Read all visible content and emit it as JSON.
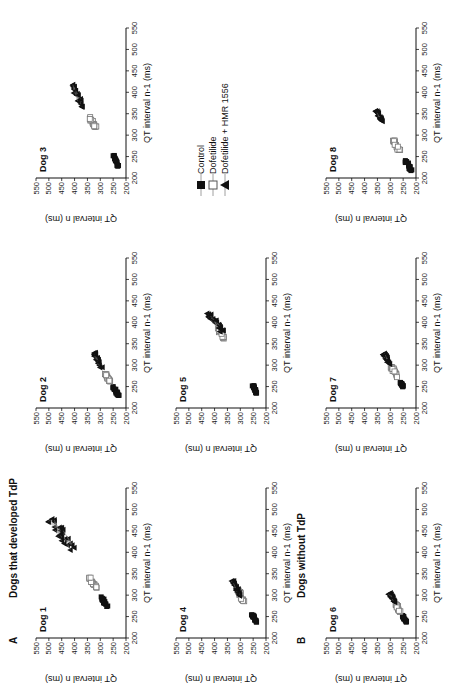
{
  "figure": {
    "sections": [
      {
        "letter": "A",
        "title": "Dogs that developed TdP"
      },
      {
        "letter": "B",
        "title": "Dogs without TdP"
      }
    ],
    "legend": {
      "items": [
        {
          "label": "Control",
          "marker": "filled-square"
        },
        {
          "label": "Dofetilide",
          "marker": "open-square"
        },
        {
          "label": "Dofetilide + HMR 1556",
          "marker": "filled-triangle"
        }
      ]
    },
    "axes": {
      "xlabel": "QT interval n-1 (ms)",
      "ylabel": "QT interval n (ms)",
      "ticks": [
        "200",
        "250",
        "300",
        "350",
        "400",
        "450",
        "500",
        "550"
      ]
    }
  },
  "chart_data": [
    {
      "type": "scatter",
      "title": "Dog 1",
      "group": "Dogs that developed TdP",
      "xlabel": "QT interval n-1 (ms)",
      "ylabel": "QT interval n (ms)",
      "xlim": [
        200,
        550
      ],
      "ylim": [
        200,
        550
      ],
      "series": [
        {
          "name": "Control",
          "center": [
            285,
            285
          ],
          "spread": [
            12,
            12
          ]
        },
        {
          "name": "Dofetilide",
          "center": [
            330,
            330
          ],
          "spread": [
            12,
            12
          ]
        },
        {
          "name": "Dofetilide + HMR 1556",
          "center": [
            440,
            450
          ],
          "spread": [
            40,
            45
          ]
        }
      ]
    },
    {
      "type": "scatter",
      "title": "Dog 2",
      "group": "Dogs that developed TdP",
      "xlabel": "QT interval n-1 (ms)",
      "ylabel": "QT interval n (ms)",
      "xlim": [
        200,
        550
      ],
      "ylim": [
        200,
        550
      ],
      "series": [
        {
          "name": "Control",
          "center": [
            240,
            240
          ],
          "spread": [
            10,
            10
          ]
        },
        {
          "name": "Dofetilide",
          "center": [
            270,
            270
          ],
          "spread": [
            10,
            10
          ]
        },
        {
          "name": "Dofetilide + HMR 1556",
          "center": [
            310,
            310
          ],
          "spread": [
            20,
            15
          ]
        }
      ]
    },
    {
      "type": "scatter",
      "title": "Dog 3",
      "group": "Dogs that developed TdP",
      "xlabel": "QT interval n-1 (ms)",
      "ylabel": "QT interval n (ms)",
      "xlim": [
        200,
        550
      ],
      "ylim": [
        200,
        550
      ],
      "series": [
        {
          "name": "Control",
          "center": [
            240,
            240
          ],
          "spread": [
            12,
            10
          ]
        },
        {
          "name": "Dofetilide",
          "center": [
            330,
            330
          ],
          "spread": [
            12,
            12
          ]
        },
        {
          "name": "Dofetilide + HMR 1556",
          "center": [
            390,
            390
          ],
          "spread": [
            30,
            25
          ]
        }
      ]
    },
    {
      "type": "scatter",
      "title": "Dog 4",
      "group": "Dogs that developed TdP",
      "xlabel": "QT interval n-1 (ms)",
      "ylabel": "QT interval n (ms)",
      "xlim": [
        200,
        550
      ],
      "ylim": [
        200,
        550
      ],
      "series": [
        {
          "name": "Control",
          "center": [
            245,
            245
          ],
          "spread": [
            10,
            10
          ]
        },
        {
          "name": "Dofetilide",
          "center": [
            300,
            300
          ],
          "spread": [
            15,
            12
          ]
        },
        {
          "name": "Dofetilide + HMR 1556",
          "center": [
            315,
            315
          ],
          "spread": [
            18,
            15
          ]
        }
      ]
    },
    {
      "type": "scatter",
      "title": "Dog 5",
      "group": "Dogs that developed TdP",
      "xlabel": "QT interval n-1 (ms)",
      "ylabel": "QT interval n (ms)",
      "xlim": [
        200,
        550
      ],
      "ylim": [
        200,
        550
      ],
      "series": [
        {
          "name": "Control",
          "center": [
            245,
            245
          ],
          "spread": [
            10,
            8
          ]
        },
        {
          "name": "Dofetilide",
          "center": [
            375,
            375
          ],
          "spread": [
            12,
            12
          ]
        },
        {
          "name": "Dofetilide + HMR 1556",
          "center": [
            400,
            400
          ],
          "spread": [
            20,
            25
          ]
        }
      ]
    },
    {
      "type": "scatter",
      "title": "Dog 6",
      "group": "Dogs without TdP",
      "xlabel": "QT interval n-1 (ms)",
      "ylabel": "QT interval n (ms)",
      "xlim": [
        200,
        550
      ],
      "ylim": [
        200,
        550
      ],
      "series": [
        {
          "name": "Control",
          "center": [
            245,
            245
          ],
          "spread": [
            8,
            8
          ]
        },
        {
          "name": "Dofetilide",
          "center": [
            270,
            270
          ],
          "spread": [
            8,
            8
          ]
        },
        {
          "name": "Dofetilide + HMR 1556",
          "center": [
            295,
            295
          ],
          "spread": [
            12,
            12
          ]
        }
      ]
    },
    {
      "type": "scatter",
      "title": "Dog 7",
      "group": "Dogs without TdP",
      "xlabel": "QT interval n-1 (ms)",
      "ylabel": "QT interval n (ms)",
      "xlim": [
        200,
        550
      ],
      "ylim": [
        200,
        550
      ],
      "series": [
        {
          "name": "Control",
          "center": [
            255,
            255
          ],
          "spread": [
            6,
            6
          ]
        },
        {
          "name": "Dofetilide",
          "center": [
            285,
            285
          ],
          "spread": [
            12,
            12
          ]
        },
        {
          "name": "Dofetilide + HMR 1556",
          "center": [
            315,
            315
          ],
          "spread": [
            12,
            12
          ]
        }
      ]
    },
    {
      "type": "scatter",
      "title": "Dog 8",
      "group": "Dogs without TdP",
      "xlabel": "QT interval n-1 (ms)",
      "ylabel": "QT interval n (ms)",
      "xlim": [
        200,
        550
      ],
      "ylim": [
        200,
        550
      ],
      "series": [
        {
          "name": "Control",
          "center": [
            230,
            230
          ],
          "spread": [
            12,
            12
          ]
        },
        {
          "name": "Dofetilide",
          "center": [
            275,
            275
          ],
          "spread": [
            12,
            12
          ]
        },
        {
          "name": "Dofetilide + HMR 1556",
          "center": [
            345,
            345
          ],
          "spread": [
            12,
            12
          ]
        }
      ]
    }
  ]
}
